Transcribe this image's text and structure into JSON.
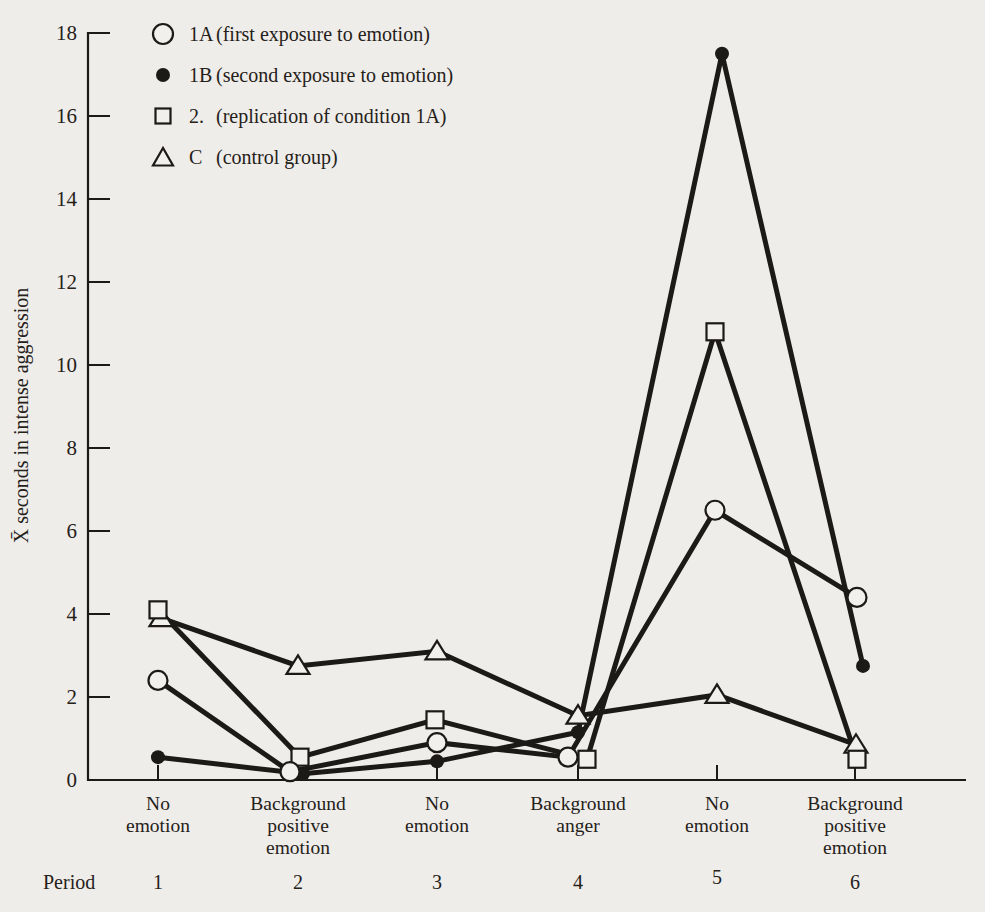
{
  "figure": {
    "background": "#efede9",
    "ink": "#1c1a17",
    "marker_fill": "#f2f0ec"
  },
  "legend": {
    "items": [
      {
        "code": "1A",
        "description": "(first exposure to emotion)",
        "marker": "open-circle"
      },
      {
        "code": "1B",
        "description": "(second exposure to emotion)",
        "marker": "filled-circle"
      },
      {
        "code": "2.",
        "description": "(replication of condition 1A)",
        "marker": "open-square"
      },
      {
        "code": "C",
        "description": "(control group)",
        "marker": "open-triangle"
      }
    ]
  },
  "chart_data": {
    "type": "line",
    "title": "",
    "ylabel": "X̄ seconds in intense aggression",
    "xlabel_row_label": "Period",
    "ylim": [
      0,
      18
    ],
    "yticks": [
      0,
      2,
      4,
      6,
      8,
      10,
      12,
      14,
      16,
      18
    ],
    "grid": false,
    "legend_position": "top-left",
    "categories": [
      [
        "No",
        "emotion"
      ],
      [
        "Background",
        "positive",
        "emotion"
      ],
      [
        "No",
        "emotion"
      ],
      [
        "Background",
        "anger"
      ],
      [
        "No",
        "emotion"
      ],
      [
        "Background",
        "positive",
        "emotion"
      ]
    ],
    "period_numbers": [
      "1",
      "2",
      "3",
      "4",
      "5",
      "6"
    ],
    "series": [
      {
        "name": "1A",
        "marker": "open-circle",
        "values": [
          2.4,
          0.2,
          0.9,
          0.55,
          6.5,
          4.4
        ],
        "x_jitter": [
          0,
          -8,
          0,
          -10,
          -2,
          2
        ]
      },
      {
        "name": "1B",
        "marker": "filled-circle",
        "values": [
          0.55,
          0.15,
          0.45,
          1.15,
          17.5,
          2.75
        ],
        "x_jitter": [
          0,
          5,
          0,
          0,
          5,
          8
        ]
      },
      {
        "name": "2",
        "marker": "open-square",
        "values": [
          4.1,
          0.55,
          1.45,
          0.5,
          10.8,
          0.5
        ],
        "x_jitter": [
          0,
          2,
          -2,
          9,
          -2,
          2
        ]
      },
      {
        "name": "C",
        "marker": "open-triangle",
        "values": [
          3.9,
          2.75,
          3.1,
          1.55,
          2.05,
          0.85
        ],
        "x_jitter": [
          3,
          0,
          0,
          0,
          0,
          1
        ]
      }
    ],
    "layout": {
      "plot_left": 88,
      "plot_top": 33,
      "plot_bottom": 780,
      "axis_right": 966,
      "period_x": [
        158,
        298,
        437,
        578,
        717,
        855
      ],
      "ytick_len": 22,
      "xtick_len": 15,
      "line_width": 5,
      "axis_width": 2.2
    }
  }
}
